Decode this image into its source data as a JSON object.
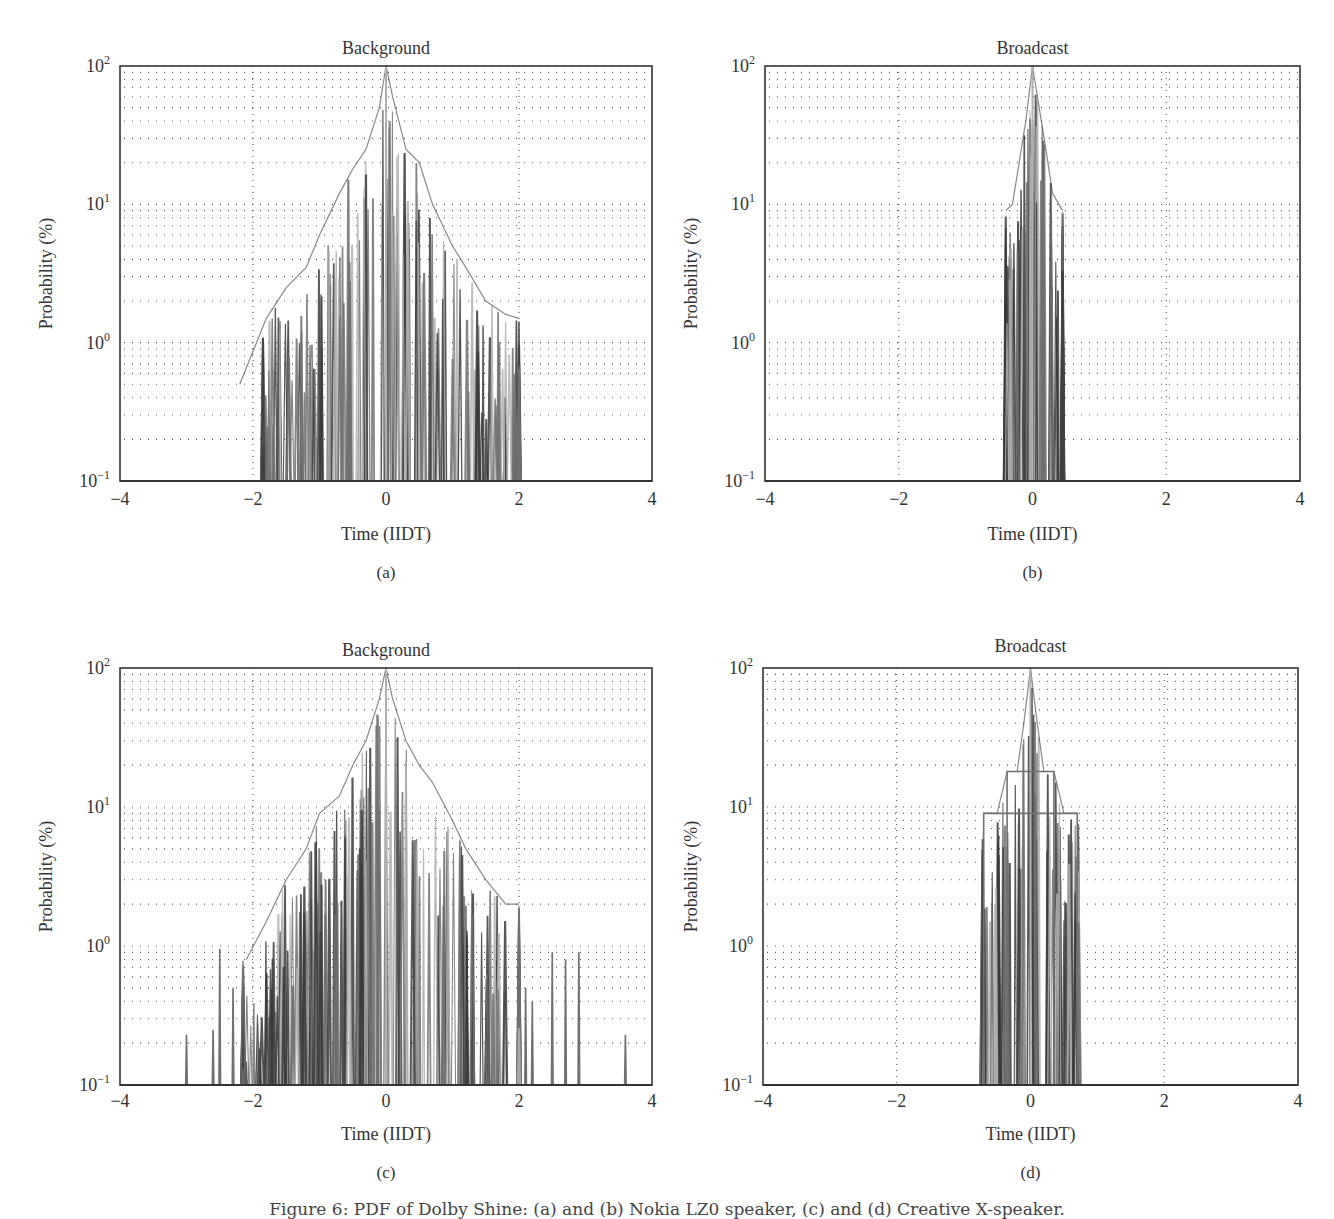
{
  "figure": {
    "caption": "Figure 6: PDF of Dolby Shine: (a) and (b) Nokia LZ0 speaker, (c) and (d) Creative X-speaker."
  },
  "colors": {
    "frame": "#333333",
    "grid": "#555555",
    "trace_dark": "#3a3a3a",
    "trace_mid": "#707070",
    "trace_light": "#b0b0b0",
    "text": "#333333"
  },
  "axes_common": {
    "xlabel": "Time (IIDT)",
    "ylabel": "Probability (%)",
    "xticks": [
      -4,
      -2,
      0,
      2,
      4
    ],
    "xtick_labels": [
      "−4",
      "−2",
      "0",
      "2",
      "4"
    ],
    "yticks_exp": [
      -1,
      0,
      1,
      2
    ],
    "ytick_labels": [
      "10⁻¹",
      "10⁰",
      "10¹",
      "10²"
    ],
    "xlim": [
      -4,
      4
    ],
    "ylim": [
      0.1,
      100
    ],
    "yscale": "log",
    "grid": "dotted"
  },
  "chart_data": [
    {
      "id": "a",
      "type": "line",
      "panel_label": "(a)",
      "title": "Background",
      "xlabel": "Time (IIDT)",
      "ylabel": "Probability (%)",
      "xlim": [
        -4,
        4
      ],
      "ylim": [
        0.1,
        100
      ],
      "yscale": "log",
      "grid": true,
      "description": "Overlaid PDF traces of many speakers; narrow spikes with envelope peaking at 0",
      "series": [
        {
          "name": "envelope (max probability %)",
          "x": [
            -2.2,
            -1.8,
            -1.5,
            -1.2,
            -1.0,
            -0.7,
            -0.5,
            -0.3,
            -0.1,
            0.0,
            0.1,
            0.3,
            0.5,
            0.7,
            1.0,
            1.2,
            1.5,
            1.8,
            2.0
          ],
          "values": [
            0.5,
            1.5,
            2.5,
            3.5,
            6,
            12,
            18,
            25,
            50,
            100,
            60,
            25,
            20,
            10,
            5,
            3.5,
            2,
            1.6,
            1.5
          ]
        }
      ],
      "support": [
        -1.85,
        2.0
      ],
      "spike_count": 170,
      "seed": 11,
      "pixel_box": {
        "left": 120,
        "top": 66,
        "width": 532,
        "height": 415,
        "title_y": 48,
        "ticks_y": 505,
        "xlabel_y": 540,
        "panel_label_y": 578,
        "ylabel_x": 52
      }
    },
    {
      "id": "b",
      "type": "line",
      "panel_label": "(b)",
      "title": "Broadcast",
      "xlabel": "Time (IIDT)",
      "ylabel": "Probability (%)",
      "xlim": [
        -4,
        4
      ],
      "ylim": [
        0.1,
        100
      ],
      "yscale": "log",
      "grid": true,
      "description": "Narrow PDF concentrated within roughly -0.4 to 0.45 IIDT",
      "series": [
        {
          "name": "envelope (max probability %)",
          "x": [
            -0.4,
            -0.3,
            -0.2,
            -0.1,
            0.0,
            0.1,
            0.2,
            0.3,
            0.45
          ],
          "values": [
            9,
            10,
            20,
            40,
            100,
            50,
            25,
            12,
            9
          ]
        }
      ],
      "support": [
        -0.4,
        0.45
      ],
      "spike_count": 70,
      "seed": 23,
      "pixel_box": {
        "left": 765,
        "top": 66,
        "width": 535,
        "height": 415,
        "title_y": 48,
        "ticks_y": 505,
        "xlabel_y": 540,
        "panel_label_y": 578,
        "ylabel_x": 697
      }
    },
    {
      "id": "c",
      "type": "line",
      "panel_label": "(c)",
      "title": "Background",
      "xlabel": "Time (IIDT)",
      "ylabel": "Probability (%)",
      "xlim": [
        -4,
        4
      ],
      "ylim": [
        0.1,
        100
      ],
      "yscale": "log",
      "grid": true,
      "description": "Broader PDF with isolated outlier spikes in the tails",
      "series": [
        {
          "name": "envelope (max probability %)",
          "x": [
            -2.1,
            -1.8,
            -1.5,
            -1.2,
            -1.0,
            -0.7,
            -0.5,
            -0.3,
            -0.1,
            0.0,
            0.1,
            0.3,
            0.5,
            0.7,
            1.0,
            1.2,
            1.5,
            1.8,
            2.0
          ],
          "values": [
            0.8,
            1.5,
            3,
            5,
            9,
            12,
            20,
            30,
            60,
            100,
            60,
            30,
            20,
            15,
            8,
            5,
            3,
            2,
            2
          ]
        },
        {
          "name": "isolated tail spikes (%)",
          "x": [
            -3.0,
            -2.6,
            -2.5,
            -2.3,
            2.1,
            2.2,
            2.5,
            2.7,
            2.9,
            3.6
          ],
          "values": [
            0.23,
            0.25,
            0.95,
            0.5,
            0.5,
            0.4,
            0.9,
            0.8,
            0.9,
            0.23
          ]
        }
      ],
      "support": [
        -2.15,
        2.0
      ],
      "spike_count": 220,
      "seed": 37,
      "pixel_box": {
        "left": 120,
        "top": 668,
        "width": 532,
        "height": 417,
        "title_y": 650,
        "ticks_y": 1107,
        "xlabel_y": 1140,
        "panel_label_y": 1178,
        "ylabel_x": 52
      }
    },
    {
      "id": "d",
      "type": "line",
      "panel_label": "(d)",
      "title": "Broadcast",
      "xlabel": "Time (IIDT)",
      "ylabel": "Probability (%)",
      "xlim": [
        -4,
        4
      ],
      "ylim": [
        0.1,
        100
      ],
      "yscale": "log",
      "grid": true,
      "description": "PDF concentrated within roughly -0.7 to 0.7 IIDT with stepped plateaus at ~9% and ~18%",
      "series": [
        {
          "name": "envelope (max probability %)",
          "x": [
            -0.7,
            -0.5,
            -0.35,
            -0.2,
            -0.1,
            0.0,
            0.1,
            0.2,
            0.35,
            0.5,
            0.7
          ],
          "values": [
            9,
            9,
            18,
            18,
            40,
            100,
            40,
            18,
            18,
            9,
            9
          ]
        }
      ],
      "plateaus": [
        {
          "x": [
            -0.7,
            0.7
          ],
          "value": 9
        },
        {
          "x": [
            -0.35,
            0.35
          ],
          "value": 18
        }
      ],
      "support": [
        -0.72,
        0.72
      ],
      "spike_count": 90,
      "seed": 53,
      "pixel_box": {
        "left": 763,
        "top": 668,
        "width": 535,
        "height": 417,
        "title_y": 646,
        "ticks_y": 1107,
        "xlabel_y": 1140,
        "panel_label_y": 1178,
        "ylabel_x": 697
      }
    }
  ]
}
